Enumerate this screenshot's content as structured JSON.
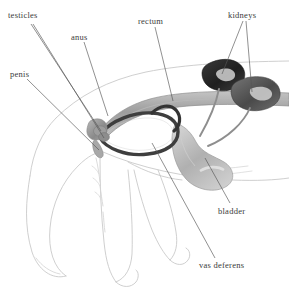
{
  "figure": {
    "style": "grayscale-pencil-illustration",
    "width": 289,
    "height": 292,
    "background_color": "#ffffff"
  },
  "labels": [
    {
      "id": "testicles",
      "text": "testicles",
      "x": 8,
      "y": 11,
      "leader_count": 2
    },
    {
      "id": "anus",
      "text": "anus",
      "x": 71,
      "y": 33,
      "leader_count": 1
    },
    {
      "id": "rectum",
      "text": "rectum",
      "x": 138,
      "y": 17,
      "leader_count": 1
    },
    {
      "id": "kidneys",
      "text": "kidneys",
      "x": 228,
      "y": 11,
      "leader_count": 2
    },
    {
      "id": "penis",
      "text": "penis",
      "x": 10,
      "y": 70,
      "leader_count": 1
    },
    {
      "id": "bladder",
      "text": "bladder",
      "x": 218,
      "y": 207,
      "leader_count": 1
    },
    {
      "id": "vas_deferens",
      "text": "vas deferens",
      "x": 199,
      "y": 261,
      "leader_count": 1
    }
  ],
  "organs": [
    {
      "id": "left-kidney",
      "name": "kidney",
      "shade": "#2b2b2b",
      "description": "dark bean-shaped organ, upper right"
    },
    {
      "id": "right-kidney",
      "name": "kidney",
      "shade": "#5e5e5e",
      "description": "mid-gray bean-shaped organ, far right"
    },
    {
      "id": "rectum-tube",
      "name": "rectum",
      "shade": "#9a9a9a",
      "description": "gray tube arching left to right"
    },
    {
      "id": "bladder-sac",
      "name": "bladder",
      "shade": "#b5b5b5",
      "description": "pale pear-shaped sac, center right"
    },
    {
      "id": "vas-loop",
      "name": "vas deferens",
      "shade": "#454545",
      "description": "dark elongated loop, center"
    },
    {
      "id": "penis-shaft",
      "name": "penis",
      "shade": "#8a8a8a",
      "description": "small tapered form, left of loop"
    },
    {
      "id": "testicle-pair",
      "name": "testicles",
      "shade": "#8f8f8f",
      "description": "small rounded pair at loop base"
    },
    {
      "id": "ureters",
      "name": "ureters",
      "shade": "#8a8a8a",
      "description": "thin tubes from kidneys to bladder"
    },
    {
      "id": "dog-outline",
      "name": "dog body",
      "shade": "#c9c9c9",
      "description": "faint pencil outline of hindquarters, tail and legs"
    }
  ],
  "colors": {
    "label_text": "#3a3a3a",
    "leader_line": "#555555",
    "body_outline": "#c9c9c9",
    "organ_dark": "#2b2b2b",
    "organ_mid": "#7d7d7d",
    "organ_light": "#bdbdbd",
    "background": "#ffffff"
  }
}
